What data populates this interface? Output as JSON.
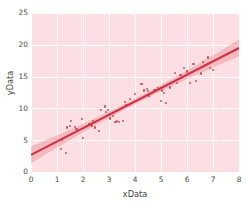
{
  "chart_data": {
    "type": "scatter",
    "title": "",
    "subtitle": "",
    "xlabel": "xData",
    "ylabel": "yData",
    "xlim": [
      0,
      8
    ],
    "ylim": [
      0,
      25
    ],
    "xticks": [
      0,
      1,
      2,
      3,
      4,
      5,
      6,
      7,
      8
    ],
    "yticks": [
      0,
      5,
      10,
      15,
      20,
      25
    ],
    "xtick_labels": [
      "0",
      "1",
      "2",
      "3",
      "4",
      "5",
      "6",
      "7",
      "8"
    ],
    "ytick_labels": [
      "0",
      "5",
      "10",
      "15",
      "20",
      "25"
    ],
    "grid": true,
    "grid_color": "#ffffff",
    "plot_background": "#fbdfe2",
    "figure_background": "#ffffff",
    "legend": null,
    "legend_position": "none",
    "point_color": "#c43a42",
    "line_color": "#cc3344",
    "band_color": "#e8737f",
    "regression": {
      "slope": 2.1,
      "intercept": 2.7,
      "x_start": 0,
      "x_end": 8,
      "y_start": 2.7,
      "y_end": 19.5,
      "ci_band": true,
      "ci_half_width_at_ends": 1.35,
      "ci_half_width_at_center": 0.45
    },
    "x": [
      1.15,
      1.2,
      1.35,
      1.4,
      1.5,
      1.55,
      1.7,
      1.75,
      1.95,
      2.0,
      2.25,
      2.3,
      2.35,
      2.4,
      2.45,
      2.6,
      2.7,
      2.85,
      2.9,
      2.95,
      3.0,
      3.05,
      3.15,
      3.25,
      3.3,
      3.4,
      3.55,
      3.6,
      3.65,
      3.8,
      4.0,
      4.25,
      4.35,
      4.45,
      4.5,
      4.55,
      4.75,
      4.9,
      5.0,
      5.05,
      5.1,
      5.2,
      5.35,
      5.55,
      5.6,
      5.75,
      5.9,
      6.0,
      6.1,
      6.25,
      6.35,
      6.55,
      6.6,
      6.8,
      6.9,
      7.0
    ],
    "y": [
      3.6,
      5.0,
      3.0,
      7.0,
      7.2,
      8.0,
      7.1,
      6.7,
      8.3,
      5.3,
      7.6,
      7.4,
      7.2,
      8.0,
      7.0,
      6.5,
      9.7,
      10.3,
      9.4,
      9.8,
      9.0,
      8.4,
      8.8,
      7.9,
      8.0,
      7.8,
      8.0,
      11.0,
      10.5,
      11.5,
      12.3,
      13.9,
      12.8,
      13.0,
      12.7,
      11.9,
      12.9,
      13.2,
      11.2,
      12.8,
      12.4,
      10.9,
      13.3,
      15.6,
      14.0,
      15.2,
      16.4,
      15.8,
      14.0,
      17.0,
      14.3,
      15.5,
      17.3,
      18.0,
      16.3,
      16.1
    ]
  }
}
